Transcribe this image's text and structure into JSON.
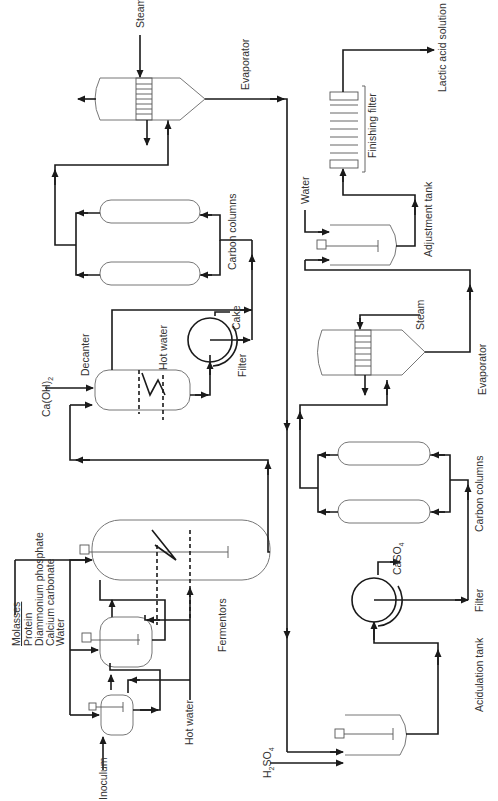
{
  "diagram": {
    "orientation": "rotated 90deg counter-clockwise",
    "colors": {
      "line": "#1a1a1a",
      "vessel": "#777777",
      "text": "#333333",
      "background": "#ffffff"
    },
    "labels": {
      "inputs_list": [
        "Molasses",
        "Protein",
        "Diammonium phosphate",
        "Calcium carbonate",
        "Water"
      ],
      "inoculum": "Inoculum",
      "hot_water_seed": "Hot water",
      "fermentors": "Fermentors",
      "caoh2": "Ca(OH)",
      "caoh2_sub": "2",
      "decanter": "Decanter",
      "hot_water_decanter": "Hot water",
      "filter1": "Filter",
      "cake": "Cake",
      "carbon_columns1": "Carbon columns",
      "steam1": "Steam",
      "evaporator1": "Evaporator",
      "h2so4": "H",
      "h2so4_sub": "2",
      "h2so4_tail": "SO",
      "h2so4_sub2": "4",
      "acidulation_tank": "Acidulation tank",
      "filter2": "Filter",
      "caso4": "CaSO",
      "caso4_sub": "4",
      "carbon_columns2": "Carbon columns",
      "steam2": "Steam",
      "evaporator2": "Evaporator",
      "water": "Water",
      "adjustment_tank": "Adjustment tank",
      "finishing_filter": "Finishing filter",
      "product": "Lactic acid solution"
    },
    "equipment": [
      "Seed tank 1",
      "Seed tank 2",
      "Fermentor",
      "Decanter",
      "Rotary filter 1",
      "Carbon columns 1 (x2)",
      "Evaporator 1",
      "Acidulation tank",
      "Rotary filter 2",
      "Carbon columns 2 (x2)",
      "Evaporator 2",
      "Adjustment tank",
      "Finishing filter"
    ]
  }
}
